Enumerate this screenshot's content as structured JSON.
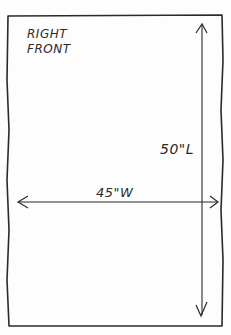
{
  "diagram": {
    "title_lines": [
      "RIGHT",
      "FRONT"
    ],
    "width_label": "45\"W",
    "length_label": "50\"L",
    "width_value": 45,
    "length_value": 50,
    "unit": "inches",
    "colors": {
      "ink": "#2a2a2a",
      "paper": "#fdfdfd"
    }
  }
}
